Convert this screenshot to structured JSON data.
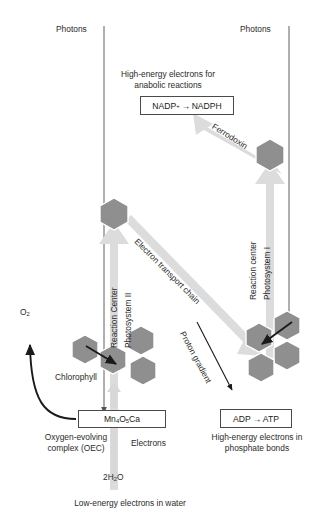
{
  "diagram": {
    "colors": {
      "hexagon_fill": "#8f8f8f",
      "hexagon_stroke": "#ffffff",
      "pale_arrow": "#d8d8d8",
      "photon_line": "#b9b9b9",
      "black_arrow": "#1a1a1a",
      "box_border": "#4a4a4a",
      "text": "#2b2b2b",
      "background": "#ffffff"
    },
    "photons": {
      "left_label": "Photons",
      "right_label": "Photons"
    },
    "top_caption": {
      "line1": "High-energy electrons for",
      "line2": "anabolic reactions"
    },
    "nadp_box": {
      "reactant": "NADP",
      "reactant_charge": "+",
      "arrow": "→",
      "product": "NADPH"
    },
    "adp_box": {
      "reactant": "ADP",
      "arrow": "→",
      "product": "ATP"
    },
    "adp_caption": {
      "line1": "High-energy electrons in",
      "line2": "phosphate bonds"
    },
    "mn_box": {
      "formula_prefix": "Mn",
      "sub1": "4",
      "mid": "O",
      "sub2": "5",
      "suffix": "Ca"
    },
    "oec_caption": {
      "line1": "Oxygen-evolving",
      "line2": "complex (OEC)"
    },
    "electrons_label": "Electrons",
    "water": {
      "prefix": "2H",
      "sub": "2",
      "suffix": "O"
    },
    "bottom_caption": "Low-energy electrons in water",
    "oxygen": {
      "symbol": "O",
      "sub": "2"
    },
    "chlorophyll_label": "Chlorophyll",
    "psii": {
      "reaction_center": "Reaction Center",
      "name": "Photosystem II"
    },
    "psi": {
      "reaction_center": "Reaction center",
      "name": "Photosystem I"
    },
    "etc_label": "Electron transport chain",
    "proton_label": "Proton gradient",
    "ferredoxin_label": "Ferrodoxin"
  }
}
